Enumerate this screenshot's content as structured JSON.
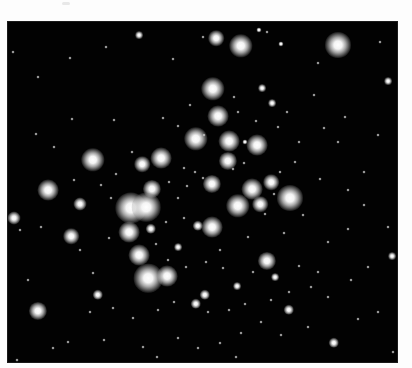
{
  "image": {
    "subject": "star cluster photograph",
    "background_color": "#020202",
    "page_color": "#fdfdfd",
    "frame": {
      "left": 8,
      "top": 22,
      "width": 389,
      "height": 340
    }
  },
  "stars": [
    {
      "x": 208,
      "y": 16,
      "r": 6
    },
    {
      "x": 233,
      "y": 24,
      "r": 9
    },
    {
      "x": 330,
      "y": 23,
      "r": 10
    },
    {
      "x": 131,
      "y": 13,
      "r": 3
    },
    {
      "x": 251,
      "y": 8,
      "r": 2
    },
    {
      "x": 205,
      "y": 67,
      "r": 9
    },
    {
      "x": 254,
      "y": 66,
      "r": 3
    },
    {
      "x": 210,
      "y": 94,
      "r": 8
    },
    {
      "x": 188,
      "y": 117,
      "r": 9
    },
    {
      "x": 221,
      "y": 119,
      "r": 8
    },
    {
      "x": 249,
      "y": 123,
      "r": 8
    },
    {
      "x": 85,
      "y": 138,
      "r": 9
    },
    {
      "x": 153,
      "y": 136,
      "r": 8
    },
    {
      "x": 134,
      "y": 142,
      "r": 6
    },
    {
      "x": 220,
      "y": 139,
      "r": 7
    },
    {
      "x": 40,
      "y": 168,
      "r": 8
    },
    {
      "x": 144,
      "y": 167,
      "r": 7
    },
    {
      "x": 204,
      "y": 162,
      "r": 7
    },
    {
      "x": 244,
      "y": 167,
      "r": 8
    },
    {
      "x": 263,
      "y": 160,
      "r": 6
    },
    {
      "x": 282,
      "y": 176,
      "r": 10
    },
    {
      "x": 123,
      "y": 186,
      "r": 12
    },
    {
      "x": 138,
      "y": 185,
      "r": 11
    },
    {
      "x": 230,
      "y": 184,
      "r": 9
    },
    {
      "x": 252,
      "y": 182,
      "r": 6
    },
    {
      "x": 72,
      "y": 182,
      "r": 5
    },
    {
      "x": 6,
      "y": 196,
      "r": 5
    },
    {
      "x": 121,
      "y": 210,
      "r": 8
    },
    {
      "x": 143,
      "y": 207,
      "r": 4
    },
    {
      "x": 204,
      "y": 205,
      "r": 8
    },
    {
      "x": 190,
      "y": 204,
      "r": 4
    },
    {
      "x": 63,
      "y": 214,
      "r": 6
    },
    {
      "x": 131,
      "y": 233,
      "r": 8
    },
    {
      "x": 259,
      "y": 239,
      "r": 7
    },
    {
      "x": 140,
      "y": 256,
      "r": 11
    },
    {
      "x": 159,
      "y": 254,
      "r": 8
    },
    {
      "x": 90,
      "y": 273,
      "r": 4
    },
    {
      "x": 197,
      "y": 273,
      "r": 4
    },
    {
      "x": 188,
      "y": 282,
      "r": 4
    },
    {
      "x": 281,
      "y": 288,
      "r": 4
    },
    {
      "x": 30,
      "y": 289,
      "r": 7
    },
    {
      "x": 229,
      "y": 264,
      "r": 3
    },
    {
      "x": 267,
      "y": 255,
      "r": 3
    },
    {
      "x": 264,
      "y": 81,
      "r": 3
    },
    {
      "x": 380,
      "y": 59,
      "r": 3
    },
    {
      "x": 384,
      "y": 234,
      "r": 3
    },
    {
      "x": 326,
      "y": 321,
      "r": 4
    },
    {
      "x": 170,
      "y": 225,
      "r": 3
    },
    {
      "x": 237,
      "y": 120,
      "r": 2
    },
    {
      "x": 273,
      "y": 22,
      "r": 2
    }
  ],
  "faint_stars": [
    [
      5,
      30
    ],
    [
      30,
      55
    ],
    [
      62,
      36
    ],
    [
      98,
      25
    ],
    [
      165,
      37
    ],
    [
      195,
      15
    ],
    [
      259,
      10
    ],
    [
      310,
      41
    ],
    [
      372,
      20
    ],
    [
      356,
      150
    ],
    [
      370,
      113
    ],
    [
      337,
      95
    ],
    [
      306,
      73
    ],
    [
      279,
      90
    ],
    [
      270,
      105
    ],
    [
      230,
      90
    ],
    [
      226,
      75
    ],
    [
      196,
      113
    ],
    [
      170,
      104
    ],
    [
      155,
      96
    ],
    [
      124,
      130
    ],
    [
      108,
      152
    ],
    [
      93,
      163
    ],
    [
      66,
      158
    ],
    [
      46,
      125
    ],
    [
      28,
      112
    ],
    [
      64,
      97
    ],
    [
      106,
      98
    ],
    [
      182,
      83
    ],
    [
      248,
      99
    ],
    [
      287,
      140
    ],
    [
      312,
      157
    ],
    [
      295,
      193
    ],
    [
      320,
      220
    ],
    [
      340,
      207
    ],
    [
      380,
      205
    ],
    [
      360,
      245
    ],
    [
      343,
      258
    ],
    [
      310,
      250
    ],
    [
      291,
      244
    ],
    [
      263,
      278
    ],
    [
      237,
      282
    ],
    [
      221,
      288
    ],
    [
      200,
      290
    ],
    [
      166,
      280
    ],
    [
      150,
      288
    ],
    [
      125,
      296
    ],
    [
      105,
      286
    ],
    [
      82,
      290
    ],
    [
      60,
      320
    ],
    [
      45,
      326
    ],
    [
      20,
      258
    ],
    [
      12,
      208
    ],
    [
      33,
      205
    ],
    [
      72,
      228
    ],
    [
      85,
      251
    ],
    [
      101,
      216
    ],
    [
      158,
      200
    ],
    [
      176,
      196
    ],
    [
      212,
      228
    ],
    [
      240,
      215
    ],
    [
      276,
      211
    ],
    [
      245,
      250
    ],
    [
      215,
      246
    ],
    [
      198,
      240
    ],
    [
      178,
      245
    ],
    [
      160,
      238
    ],
    [
      148,
      222
    ],
    [
      103,
      176
    ],
    [
      176,
      146
    ],
    [
      187,
      150
    ],
    [
      195,
      156
    ],
    [
      161,
      160
    ],
    [
      170,
      176
    ],
    [
      179,
      164
    ],
    [
      225,
      147
    ],
    [
      236,
      141
    ],
    [
      272,
      150
    ],
    [
      257,
      192
    ],
    [
      266,
      172
    ],
    [
      300,
      305
    ],
    [
      273,
      313
    ],
    [
      253,
      300
    ],
    [
      233,
      311
    ],
    [
      212,
      321
    ],
    [
      190,
      326
    ],
    [
      170,
      316
    ],
    [
      135,
      325
    ],
    [
      96,
      318
    ],
    [
      350,
      297
    ],
    [
      320,
      275
    ],
    [
      303,
      265
    ],
    [
      370,
      290
    ],
    [
      385,
      330
    ],
    [
      340,
      168
    ],
    [
      356,
      183
    ],
    [
      330,
      120
    ],
    [
      291,
      120
    ],
    [
      316,
      106
    ],
    [
      9,
      338
    ],
    [
      149,
      335
    ],
    [
      228,
      335
    ],
    [
      281,
      270
    ]
  ]
}
